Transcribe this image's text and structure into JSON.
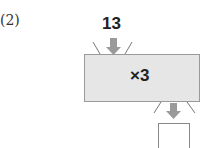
{
  "problem": {
    "label": "(2)",
    "input_value": "13",
    "operation": "×3",
    "output_value": ""
  },
  "colors": {
    "machine_fill": "#e6e6e6",
    "arrow": "#9a9a9a",
    "text": "#222222"
  }
}
